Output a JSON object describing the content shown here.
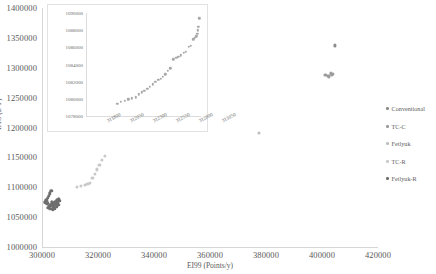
{
  "chart_data": {
    "type": "scatter",
    "title": "",
    "xlabel": "EI99 (Points/y)",
    "ylabel": "TAC ($/Y)",
    "xlim": [
      300000,
      420000
    ],
    "ylim": [
      1000000,
      1400000
    ],
    "xticks": [
      "300000",
      "320000",
      "340000",
      "360000",
      "380000",
      "400000",
      "420000"
    ],
    "yticks": [
      "1000000",
      "1050000",
      "1100000",
      "1150000",
      "1200000",
      "1250000",
      "1300000",
      "1350000",
      "1400000"
    ],
    "grid": false,
    "legend_position": "right",
    "series": [
      {
        "name": "Conventional",
        "color": "#8c8c8c",
        "points": [
          [
            404600,
            1337500
          ]
        ]
      },
      {
        "name": "TC-C",
        "color": "#9b9b9b",
        "points": [
          [
            401200,
            1288000
          ],
          [
            402000,
            1286500
          ],
          [
            402600,
            1285500
          ],
          [
            403100,
            1290500
          ],
          [
            403600,
            1287500
          ],
          [
            404000,
            1289500
          ]
        ]
      },
      {
        "name": "Fetlyuk",
        "color": "#bdbdbd",
        "points": [
          [
            377500,
            1190500
          ]
        ]
      },
      {
        "name": "TC-R",
        "color": "#c9c9c9",
        "points": [
          [
            312500,
            1100000
          ],
          [
            314000,
            1102500
          ],
          [
            315200,
            1104500
          ],
          [
            316200,
            1106000
          ],
          [
            317000,
            1107500
          ],
          [
            322500,
            1152000
          ],
          [
            321500,
            1146000
          ],
          [
            320500,
            1138000
          ],
          [
            319600,
            1130000
          ],
          [
            318800,
            1122000
          ],
          [
            318000,
            1115000
          ]
        ]
      },
      {
        "name": "Fetlyuk-R",
        "color": "#6e6e6e",
        "points": [
          [
            301200,
            1075000
          ],
          [
            301600,
            1078000
          ],
          [
            302000,
            1082000
          ],
          [
            302400,
            1086000
          ],
          [
            302800,
            1090000
          ],
          [
            303300,
            1094000
          ],
          [
            303000,
            1070000
          ],
          [
            303600,
            1072000
          ],
          [
            304200,
            1074000
          ],
          [
            304800,
            1076000
          ],
          [
            305400,
            1078000
          ],
          [
            306000,
            1080000
          ],
          [
            302200,
            1066000
          ],
          [
            303000,
            1064000
          ],
          [
            303800,
            1063000
          ],
          [
            304600,
            1065000
          ],
          [
            305200,
            1068000
          ],
          [
            305800,
            1071000
          ],
          [
            301800,
            1072000
          ],
          [
            302600,
            1069000
          ],
          [
            304000,
            1068000
          ],
          [
            304400,
            1071000
          ],
          [
            305000,
            1073000
          ],
          [
            305600,
            1075000
          ],
          [
            306200,
            1077000
          ],
          [
            302000,
            1074000
          ],
          [
            303400,
            1076000
          ]
        ]
      }
    ],
    "inset": {
      "type": "scatter",
      "xlim": [
        311500,
        312750
      ],
      "ylim": [
        1078000,
        1090000
      ],
      "xticks": [
        "311800",
        "312050",
        "312300",
        "312550",
        "312800",
        "313050"
      ],
      "yticks": [
        "1078000",
        "1080000",
        "1082000",
        "1084000",
        "1086000",
        "1088000",
        "1090000"
      ],
      "grid": false,
      "points": [
        [
          311840,
          1079450
        ],
        [
          311880,
          1079650
        ],
        [
          311920,
          1079780
        ],
        [
          311960,
          1079950
        ],
        [
          312000,
          1080050
        ],
        [
          312040,
          1080200
        ],
        [
          312075,
          1080550
        ],
        [
          312105,
          1080750
        ],
        [
          312135,
          1080900
        ],
        [
          312165,
          1081200
        ],
        [
          312195,
          1081400
        ],
        [
          312225,
          1081700
        ],
        [
          312255,
          1081950
        ],
        [
          312285,
          1082200
        ],
        [
          312310,
          1082300
        ],
        [
          312335,
          1082550
        ],
        [
          312360,
          1082850
        ],
        [
          312390,
          1083250
        ],
        [
          312415,
          1083550
        ],
        [
          312450,
          1084600
        ],
        [
          312480,
          1084750
        ],
        [
          312505,
          1084900
        ],
        [
          312530,
          1085050
        ],
        [
          312560,
          1085350
        ],
        [
          312585,
          1085500
        ],
        [
          312615,
          1086050
        ],
        [
          312640,
          1086200
        ],
        [
          312665,
          1086950
        ],
        [
          312685,
          1087100
        ],
        [
          312700,
          1087300
        ],
        [
          312710,
          1087550
        ],
        [
          312718,
          1088000
        ],
        [
          312722,
          1088400
        ],
        [
          312730,
          1089400
        ]
      ]
    }
  }
}
